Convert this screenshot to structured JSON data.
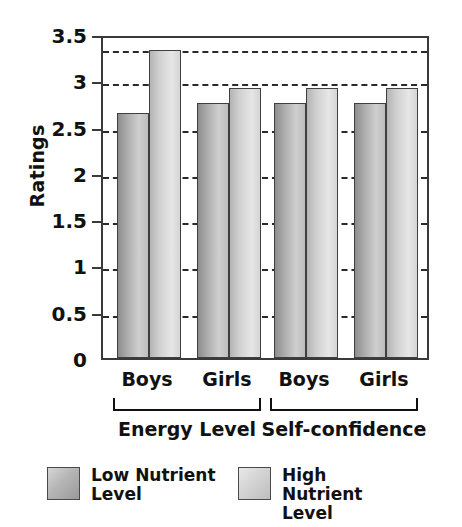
{
  "chart_data": {
    "type": "bar",
    "title": "",
    "xlabel": "",
    "ylabel": "Ratings",
    "ylim": [
      0,
      3.5
    ],
    "y_ticks": [
      "0",
      "0.5",
      "1",
      "1.5",
      "2",
      "2.5",
      "3",
      "3.5"
    ],
    "y_tick_values": [
      0,
      0.5,
      1,
      1.5,
      2,
      2.5,
      3,
      3.5
    ],
    "grid": "horizontal-dashed",
    "legend_position": "bottom",
    "categories": [
      "Boys",
      "Girls",
      "Boys",
      "Girls"
    ],
    "super_categories": [
      "Energy Level",
      "Self-confidence"
    ],
    "series": [
      {
        "name": "Low Nutrient Level",
        "values": [
          2.65,
          2.75,
          2.75,
          2.75
        ]
      },
      {
        "name": "High Nutrient Level",
        "values": [
          3.33,
          2.92,
          2.92,
          2.92
        ]
      }
    ]
  },
  "axis": {
    "y_title": "Ratings",
    "ticks": [
      {
        "label": "3.5",
        "value": 3.5
      },
      {
        "label": "3",
        "value": 3
      },
      {
        "label": "2.5",
        "value": 2.5
      },
      {
        "label": "2",
        "value": 2
      },
      {
        "label": "1.5",
        "value": 1.5
      },
      {
        "label": "1",
        "value": 1
      },
      {
        "label": "0.5",
        "value": 0.5
      },
      {
        "label": "0",
        "value": 0
      }
    ]
  },
  "x_labels": [
    {
      "label": "Boys"
    },
    {
      "label": "Girls"
    },
    {
      "label": "Boys"
    },
    {
      "label": "Girls"
    }
  ],
  "groups": [
    {
      "label": "Energy Level"
    },
    {
      "label": "Self-confidence"
    }
  ],
  "legend": {
    "items": [
      {
        "label": "Low Nutrient Level",
        "series": "low",
        "color": "#a9a9a9"
      },
      {
        "label": "High Nutrient Level",
        "series": "high",
        "color": "#d4d4d4"
      }
    ]
  },
  "colors": {
    "low_bar": "#a9a9a9",
    "high_bar": "#d4d4d4",
    "axis": "#3a3a3a",
    "grid": "#2a2a2a",
    "text": "#111111",
    "shadow": "#b9b9b9",
    "background": "#ffffff"
  }
}
